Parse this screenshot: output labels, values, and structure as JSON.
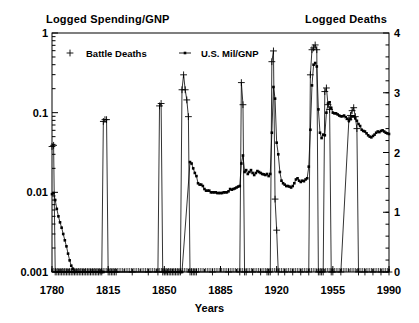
{
  "chart_data": {
    "type": "line",
    "title": "",
    "title_left": "Logged Spending/GNP",
    "title_right": "Logged Deaths",
    "xlabel": "Years",
    "ylabel": "",
    "grid": false,
    "legend_position": "top-left-inside",
    "x": [
      1780,
      1990
    ],
    "xlim": [
      1780,
      1990
    ],
    "xticks": [
      "1780",
      "1815",
      "1850",
      "1885",
      "1920",
      "1955",
      "1990"
    ],
    "xtick_values": [
      1780,
      1815,
      1850,
      1885,
      1920,
      1955,
      1990
    ],
    "left_axis": {
      "label": "Logged Spending/GNP",
      "scale": "log",
      "ylim": [
        0.001,
        1
      ],
      "yticks": [
        "0.001",
        "0.01",
        "0.1",
        "1"
      ],
      "ytick_values": [
        0.001,
        0.01,
        0.1,
        1
      ]
    },
    "right_axis": {
      "label": "Logged Deaths",
      "scale": "linear",
      "ylim": [
        0,
        4
      ],
      "yticks": [
        "0",
        "1",
        "2",
        "3",
        "4"
      ],
      "ytick_values": [
        0,
        1,
        2,
        3,
        4
      ]
    },
    "series": [
      {
        "name": "Battle Deaths",
        "axis": "right",
        "marker": "plus",
        "color": "#000000",
        "points": [
          [
            1780,
            2.1
          ],
          [
            1781,
            2.12
          ],
          [
            1782,
            0.0
          ],
          [
            1783,
            0.0
          ],
          [
            1784,
            0.0
          ],
          [
            1785,
            0.0
          ],
          [
            1786,
            0.0
          ],
          [
            1787,
            0.0
          ],
          [
            1788,
            0.0
          ],
          [
            1789,
            0.0
          ],
          [
            1790,
            0.0
          ],
          [
            1791,
            0.0
          ],
          [
            1792,
            0.0
          ],
          [
            1793,
            0.0
          ],
          [
            1794,
            0.0
          ],
          [
            1795,
            0.0
          ],
          [
            1796,
            0.0
          ],
          [
            1797,
            0.0
          ],
          [
            1798,
            0.0
          ],
          [
            1799,
            0.0
          ],
          [
            1800,
            0.0
          ],
          [
            1801,
            0.0
          ],
          [
            1802,
            0.0
          ],
          [
            1803,
            0.0
          ],
          [
            1804,
            0.0
          ],
          [
            1805,
            0.0
          ],
          [
            1806,
            0.0
          ],
          [
            1807,
            0.0
          ],
          [
            1808,
            0.0
          ],
          [
            1809,
            0.0
          ],
          [
            1810,
            0.0
          ],
          [
            1811,
            0.0
          ],
          [
            1812,
            2.52
          ],
          [
            1813,
            2.55
          ],
          [
            1814,
            2.55
          ],
          [
            1815,
            0.0
          ],
          [
            1816,
            0.0
          ],
          [
            1817,
            0.0
          ],
          [
            1818,
            0.0
          ],
          [
            1819,
            0.0
          ],
          [
            1820,
            0.0
          ],
          [
            1830,
            0.0
          ],
          [
            1840,
            0.0
          ],
          [
            1846,
            0.0
          ],
          [
            1847,
            2.78
          ],
          [
            1848,
            2.82
          ],
          [
            1849,
            0.0
          ],
          [
            1850,
            0.0
          ],
          [
            1851,
            0.0
          ],
          [
            1852,
            0.0
          ],
          [
            1853,
            0.0
          ],
          [
            1854,
            0.0
          ],
          [
            1855,
            0.0
          ],
          [
            1856,
            0.0
          ],
          [
            1857,
            0.0
          ],
          [
            1858,
            0.0
          ],
          [
            1859,
            0.0
          ],
          [
            1860,
            0.0
          ],
          [
            1861,
            3.05
          ],
          [
            1862,
            3.3
          ],
          [
            1863,
            3.05
          ],
          [
            1864,
            2.88
          ],
          [
            1865,
            2.6
          ],
          [
            1866,
            0.0
          ],
          [
            1867,
            0.0
          ],
          [
            1868,
            0.0
          ],
          [
            1869,
            0.0
          ],
          [
            1870,
            0.0
          ],
          [
            1880,
            0.0
          ],
          [
            1890,
            0.0
          ],
          [
            1897,
            0.0
          ],
          [
            1898,
            3.17
          ],
          [
            1899,
            2.8
          ],
          [
            1900,
            0.0
          ],
          [
            1901,
            0.0
          ],
          [
            1905,
            0.0
          ],
          [
            1910,
            0.0
          ],
          [
            1914,
            0.0
          ],
          [
            1915,
            0.0
          ],
          [
            1916,
            0.0
          ],
          [
            1917,
            3.52
          ],
          [
            1918,
            3.7
          ],
          [
            1919,
            1.22
          ],
          [
            1920,
            0.7
          ],
          [
            1921,
            0.0
          ],
          [
            1925,
            0.0
          ],
          [
            1930,
            0.0
          ],
          [
            1935,
            0.0
          ],
          [
            1940,
            0.0
          ],
          [
            1941,
            3.3
          ],
          [
            1942,
            3.72
          ],
          [
            1943,
            3.75
          ],
          [
            1944,
            3.8
          ],
          [
            1945,
            3.72
          ],
          [
            1946,
            0.0
          ],
          [
            1947,
            0.0
          ],
          [
            1948,
            0.0
          ],
          [
            1949,
            0.0
          ],
          [
            1950,
            3.02
          ],
          [
            1951,
            3.08
          ],
          [
            1952,
            2.8
          ],
          [
            1953,
            2.72
          ],
          [
            1954,
            0.0
          ],
          [
            1955,
            0.0
          ],
          [
            1960,
            0.0
          ],
          [
            1965,
            2.55
          ],
          [
            1966,
            2.62
          ],
          [
            1967,
            2.7
          ],
          [
            1968,
            2.75
          ],
          [
            1969,
            2.6
          ],
          [
            1970,
            2.4
          ],
          [
            1971,
            0.0
          ],
          [
            1975,
            0.0
          ],
          [
            1980,
            0.0
          ],
          [
            1985,
            0.0
          ],
          [
            1990,
            0.0
          ]
        ]
      },
      {
        "name": "U.S. Mil/GNP",
        "axis": "left",
        "marker": "square",
        "color": "#000000",
        "points": [
          [
            1780,
            0.0095
          ],
          [
            1781,
            0.0098
          ],
          [
            1782,
            0.008
          ],
          [
            1783,
            0.0062
          ],
          [
            1784,
            0.005
          ],
          [
            1785,
            0.0042
          ],
          [
            1786,
            0.0036
          ],
          [
            1787,
            0.003
          ],
          [
            1788,
            0.0025
          ],
          [
            1789,
            0.0021
          ],
          [
            1790,
            0.0017
          ],
          [
            1791,
            0.0014
          ],
          [
            1792,
            0.0012
          ],
          [
            1793,
            0.0011
          ],
          [
            1794,
            0.001
          ],
          [
            1810,
            0.001
          ],
          [
            1811,
            0.001
          ],
          [
            1812,
            0.001
          ],
          [
            1850,
            0.001
          ],
          [
            1851,
            0.001
          ],
          [
            1860,
            0.001
          ],
          [
            1861,
            0.001
          ],
          [
            1866,
            0.024
          ],
          [
            1867,
            0.023
          ],
          [
            1868,
            0.02
          ],
          [
            1869,
            0.0175
          ],
          [
            1870,
            0.016
          ],
          [
            1871,
            0.013
          ],
          [
            1872,
            0.0125
          ],
          [
            1873,
            0.0125
          ],
          [
            1874,
            0.012
          ],
          [
            1875,
            0.011
          ],
          [
            1876,
            0.0105
          ],
          [
            1877,
            0.0105
          ],
          [
            1878,
            0.0105
          ],
          [
            1879,
            0.01
          ],
          [
            1880,
            0.01
          ],
          [
            1881,
            0.01
          ],
          [
            1882,
            0.01
          ],
          [
            1883,
            0.0098
          ],
          [
            1884,
            0.0098
          ],
          [
            1885,
            0.0098
          ],
          [
            1886,
            0.0098
          ],
          [
            1887,
            0.01
          ],
          [
            1888,
            0.01
          ],
          [
            1889,
            0.01
          ],
          [
            1890,
            0.0103
          ],
          [
            1891,
            0.011
          ],
          [
            1892,
            0.0108
          ],
          [
            1893,
            0.011
          ],
          [
            1894,
            0.0112
          ],
          [
            1895,
            0.0115
          ],
          [
            1896,
            0.0118
          ],
          [
            1897,
            0.012
          ],
          [
            1898,
            0.023
          ],
          [
            1899,
            0.029
          ],
          [
            1900,
            0.018
          ],
          [
            1901,
            0.019
          ],
          [
            1902,
            0.017
          ],
          [
            1903,
            0.018
          ],
          [
            1904,
            0.019
          ],
          [
            1905,
            0.0175
          ],
          [
            1906,
            0.0165
          ],
          [
            1907,
            0.0175
          ],
          [
            1908,
            0.0185
          ],
          [
            1909,
            0.018
          ],
          [
            1910,
            0.0175
          ],
          [
            1911,
            0.017
          ],
          [
            1912,
            0.0168
          ],
          [
            1913,
            0.0165
          ],
          [
            1914,
            0.017
          ],
          [
            1915,
            0.016
          ],
          [
            1916,
            0.017
          ],
          [
            1917,
            0.056
          ],
          [
            1918,
            0.21
          ],
          [
            1919,
            0.15
          ],
          [
            1920,
            0.042
          ],
          [
            1921,
            0.03
          ],
          [
            1922,
            0.018
          ],
          [
            1923,
            0.014
          ],
          [
            1924,
            0.013
          ],
          [
            1925,
            0.0125
          ],
          [
            1926,
            0.012
          ],
          [
            1927,
            0.012
          ],
          [
            1928,
            0.0118
          ],
          [
            1929,
            0.0115
          ],
          [
            1930,
            0.012
          ],
          [
            1931,
            0.013
          ],
          [
            1932,
            0.0145
          ],
          [
            1933,
            0.015
          ],
          [
            1934,
            0.014
          ],
          [
            1935,
            0.0135
          ],
          [
            1936,
            0.014
          ],
          [
            1937,
            0.0138
          ],
          [
            1938,
            0.0145
          ],
          [
            1939,
            0.015
          ],
          [
            1940,
            0.021
          ],
          [
            1941,
            0.061
          ],
          [
            1942,
            0.22
          ],
          [
            1943,
            0.4
          ],
          [
            1944,
            0.42
          ],
          [
            1945,
            0.38
          ],
          [
            1946,
            0.11
          ],
          [
            1947,
            0.056
          ],
          [
            1948,
            0.048
          ],
          [
            1949,
            0.053
          ],
          [
            1950,
            0.052
          ],
          [
            1951,
            0.1
          ],
          [
            1952,
            0.13
          ],
          [
            1953,
            0.135
          ],
          [
            1954,
            0.115
          ],
          [
            1955,
            0.1
          ],
          [
            1956,
            0.098
          ],
          [
            1957,
            0.098
          ],
          [
            1958,
            0.095
          ],
          [
            1959,
            0.092
          ],
          [
            1960,
            0.09
          ],
          [
            1961,
            0.09
          ],
          [
            1962,
            0.092
          ],
          [
            1963,
            0.088
          ],
          [
            1964,
            0.084
          ],
          [
            1965,
            0.079
          ],
          [
            1966,
            0.083
          ],
          [
            1967,
            0.09
          ],
          [
            1968,
            0.09
          ],
          [
            1969,
            0.085
          ],
          [
            1970,
            0.079
          ],
          [
            1971,
            0.072
          ],
          [
            1972,
            0.068
          ],
          [
            1973,
            0.061
          ],
          [
            1974,
            0.059
          ],
          [
            1975,
            0.058
          ],
          [
            1976,
            0.055
          ],
          [
            1977,
            0.052
          ],
          [
            1978,
            0.05
          ],
          [
            1979,
            0.049
          ],
          [
            1980,
            0.051
          ],
          [
            1981,
            0.053
          ],
          [
            1982,
            0.056
          ],
          [
            1983,
            0.058
          ],
          [
            1984,
            0.057
          ],
          [
            1985,
            0.059
          ],
          [
            1986,
            0.06
          ],
          [
            1987,
            0.058
          ],
          [
            1988,
            0.056
          ],
          [
            1989,
            0.055
          ],
          [
            1990,
            0.054
          ]
        ]
      }
    ],
    "legend": [
      {
        "label": "Battle Deaths",
        "marker": "plus"
      },
      {
        "label": "U.S. Mil/GNP",
        "marker": "square"
      }
    ]
  },
  "colors": {
    "axis": "#000000",
    "line": "#000000",
    "background": "#ffffff"
  }
}
